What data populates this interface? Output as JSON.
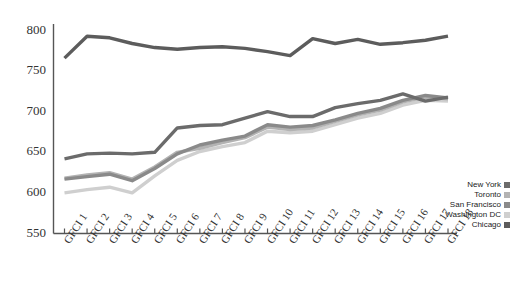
{
  "chart_data": {
    "type": "line",
    "title": "",
    "subtitle": "",
    "xlabel": "",
    "ylabel": "",
    "grid": false,
    "legend_position": "inside-right-bottom",
    "ylim": [
      550,
      800
    ],
    "yticks": [
      550,
      600,
      650,
      700,
      750,
      800
    ],
    "ytick_labels": [
      "550",
      "600",
      "650",
      "700",
      "750",
      "800"
    ],
    "categories": [
      "GFCI 1",
      "GFCI 2",
      "GFCI 3",
      "GFCI 4",
      "GFCI 5",
      "GFCI 6",
      "GFCI 7",
      "GFCI 8",
      "GFCI 9",
      "GFCI 10",
      "GFCI 11",
      "GFCI 12",
      "GFCI 13",
      "GFCI 14",
      "GFCI 15",
      "GFCI 16",
      "GFCI 17",
      "GFCI 18"
    ],
    "series": [
      {
        "name": "New York",
        "color": "#6b6b6b",
        "values": [
          642,
          648,
          649,
          648,
          650,
          680,
          683,
          684,
          692,
          700,
          694,
          694,
          705,
          710,
          714,
          722,
          713,
          718
        ]
      },
      {
        "name": "Toronto",
        "color": "#b3b3b3",
        "values": [
          618,
          622,
          625,
          617,
          632,
          650,
          655,
          662,
          668,
          681,
          678,
          680,
          688,
          696,
          702,
          712,
          718,
          716
        ]
      },
      {
        "name": "San Francisco",
        "color": "#8a8a8a",
        "values": [
          617,
          620,
          623,
          615,
          630,
          648,
          659,
          665,
          670,
          684,
          681,
          683,
          690,
          698,
          704,
          714,
          720,
          717
        ]
      },
      {
        "name": "Washington DC",
        "color": "#cfcfcf",
        "values": [
          600,
          604,
          607,
          600,
          621,
          640,
          651,
          657,
          662,
          676,
          674,
          676,
          684,
          692,
          698,
          708,
          714,
          713
        ]
      },
      {
        "name": "Chicago",
        "color": "#5c5c5c",
        "values": [
          766,
          793,
          791,
          784,
          779,
          777,
          779,
          780,
          778,
          774,
          769,
          790,
          784,
          789,
          783,
          785,
          788,
          793
        ]
      }
    ]
  },
  "legend": {
    "items": [
      {
        "label": "New York",
        "color": "#6b6b6b"
      },
      {
        "label": "Toronto",
        "color": "#b3b3b3"
      },
      {
        "label": "San Francisco",
        "color": "#8a8a8a"
      },
      {
        "label": "Washington DC",
        "color": "#cfcfcf"
      },
      {
        "label": "Chicago",
        "color": "#5c5c5c"
      }
    ]
  },
  "axes": {
    "axis_color": "#555555"
  }
}
